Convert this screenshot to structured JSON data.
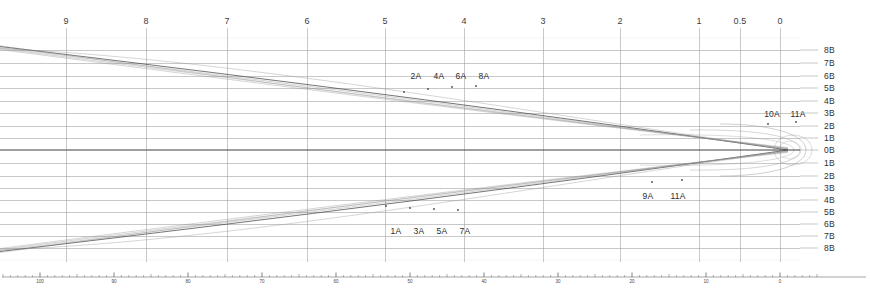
{
  "chart_data": {
    "type": "line",
    "title": "",
    "subtitle": "",
    "xlabel": "",
    "ylabel": "",
    "grid": true,
    "legend_position": "inline-annotations",
    "axes": {
      "top": {
        "name": "top-scale",
        "tick_labels": [
          "9",
          "8",
          "7",
          "6",
          "5",
          "4",
          "3",
          "2",
          "1",
          "0.5",
          "0"
        ],
        "tick_x_px": [
          66,
          146,
          227,
          307,
          385,
          464,
          543,
          620,
          699,
          740,
          780
        ],
        "direction": "decreasing-left-to-right",
        "range": [
          9,
          0
        ]
      },
      "right": {
        "name": "right-scale",
        "tick_labels": [
          "8B",
          "7B",
          "6B",
          "5B",
          "4B",
          "3B",
          "2B",
          "1B",
          "0B",
          "1B",
          "2B",
          "3B",
          "4B",
          "5B",
          "6B",
          "7B",
          "8B"
        ],
        "tick_y_px": [
          50,
          63,
          76,
          88,
          101,
          113,
          126,
          138,
          150,
          163,
          176,
          188,
          200,
          212,
          224,
          236,
          248
        ],
        "symmetric_about": "0B",
        "range": [
          8,
          -8
        ]
      },
      "bottom": {
        "name": "bottom-ruler",
        "tick_labels": [
          "100",
          "90",
          "80",
          "70",
          "60",
          "50",
          "40",
          "30",
          "20",
          "10",
          "0"
        ],
        "tick_x_px": [
          40,
          114,
          188,
          262,
          336,
          410,
          484,
          558,
          632,
          706,
          780
        ],
        "minor_ticks_per_major": 10,
        "range": [
          100,
          0
        ]
      }
    },
    "series": [
      {
        "name": "1A",
        "group": "lower",
        "style": "thin-gray"
      },
      {
        "name": "2A",
        "group": "upper",
        "style": "thin-gray"
      },
      {
        "name": "3A",
        "group": "lower",
        "style": "thin-gray"
      },
      {
        "name": "4A",
        "group": "upper",
        "style": "thin-gray"
      },
      {
        "name": "5A",
        "group": "lower",
        "style": "thin-gray"
      },
      {
        "name": "6A",
        "group": "upper",
        "style": "thin-gray"
      },
      {
        "name": "7A",
        "group": "lower",
        "style": "thin-gray"
      },
      {
        "name": "8A",
        "group": "upper",
        "style": "thin-gray"
      },
      {
        "name": "9A",
        "group": "lower-inner",
        "style": "thin-gray"
      },
      {
        "name": "10A",
        "group": "upper-inner",
        "style": "thin-gray"
      },
      {
        "name": "11A",
        "group": "inner-loop",
        "style": "thin-gray"
      },
      {
        "name": "0B",
        "group": "axis",
        "style": "dark-center"
      }
    ],
    "annotations": [
      {
        "label": "2A",
        "x_px": 416,
        "y_px": 71,
        "anchor_curve": "2A"
      },
      {
        "label": "4A",
        "x_px": 439,
        "y_px": 71,
        "anchor_curve": "4A"
      },
      {
        "label": "6A",
        "x_px": 461,
        "y_px": 71,
        "anchor_curve": "6A"
      },
      {
        "label": "8A",
        "x_px": 484,
        "y_px": 71,
        "anchor_curve": "8A"
      },
      {
        "label": "1A",
        "x_px": 396,
        "y_px": 226,
        "anchor_curve": "1A"
      },
      {
        "label": "3A",
        "x_px": 419,
        "y_px": 226,
        "anchor_curve": "3A"
      },
      {
        "label": "5A",
        "x_px": 442,
        "y_px": 226,
        "anchor_curve": "5A"
      },
      {
        "label": "7A",
        "x_px": 465,
        "y_px": 226,
        "anchor_curve": "7A"
      },
      {
        "label": "9A",
        "x_px": 648,
        "y_px": 191,
        "anchor_curve": "9A"
      },
      {
        "label": "11A",
        "x_px": 678,
        "y_px": 191,
        "anchor_curve": "11A"
      },
      {
        "label": "10A",
        "x_px": 772,
        "y_px": 109,
        "anchor_curve": "10A"
      },
      {
        "label": "11A",
        "x_px": 798,
        "y_px": 109,
        "anchor_curve": "11A"
      }
    ],
    "markers": [
      {
        "x_px": 404,
        "y_px": 92
      },
      {
        "x_px": 428,
        "y_px": 89
      },
      {
        "x_px": 452,
        "y_px": 87
      },
      {
        "x_px": 476,
        "y_px": 86
      },
      {
        "x_px": 386,
        "y_px": 206
      },
      {
        "x_px": 410,
        "y_px": 208
      },
      {
        "x_px": 434,
        "y_px": 209
      },
      {
        "x_px": 458,
        "y_px": 210
      },
      {
        "x_px": 652,
        "y_px": 182
      },
      {
        "x_px": 682,
        "y_px": 180
      },
      {
        "x_px": 768,
        "y_px": 124
      },
      {
        "x_px": 796,
        "y_px": 122
      }
    ],
    "colors": {
      "background": "#ffffff",
      "grid_major": "#9a9a9a",
      "grid_minor": "#d9d9d9",
      "curve": "#8c8c8c",
      "curve_dark": "#4a4a4a",
      "center_axis": "#404040",
      "text": "#2e2e2e",
      "ruler": "#4a4a4a"
    }
  }
}
